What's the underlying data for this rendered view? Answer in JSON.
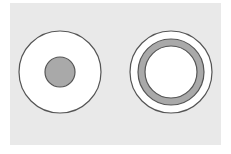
{
  "diagram": {
    "type": "concentric-circles-comparison",
    "background_color": "#e9e9e9",
    "stroke_color": "#555555",
    "fill_white": "#ffffff",
    "fill_gray": "#a9a9a9",
    "figures": [
      {
        "id": "left",
        "description": "white disc with small solid gray center disc",
        "cx": 60,
        "cy": 72,
        "outer_r": 41,
        "inner_disc_r": 15
      },
      {
        "id": "right",
        "description": "white disc with gray annulus ring and white center",
        "cx": 171,
        "cy": 72,
        "outer_r": 41,
        "ring_outer_r": 33,
        "ring_inner_r": 26
      }
    ]
  }
}
